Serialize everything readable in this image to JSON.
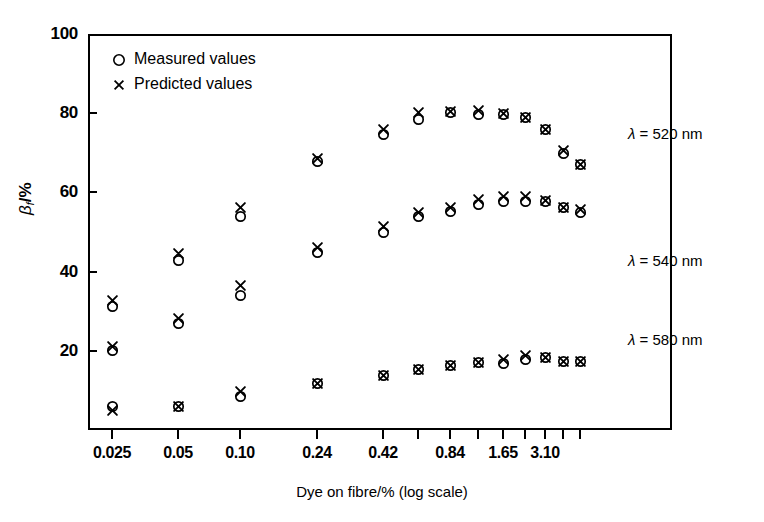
{
  "chart_data": {
    "type": "scatter",
    "title": "",
    "xlabel": "Dye on fibre/% (log scale)",
    "ylabel": "βf/%",
    "ylabel_symbol": "β",
    "ylabel_sub": "f",
    "ylabel_unit": "/%",
    "xscale": "log",
    "ylim": [
      0,
      100
    ],
    "yticks": [
      0,
      20,
      40,
      60,
      80,
      100
    ],
    "ytick_labels": [
      "",
      "20",
      "40",
      "60",
      "80",
      "100"
    ],
    "grid": false,
    "legend_position": "upper-left",
    "legend": [
      "Measured values",
      "Predicted values"
    ],
    "x": [
      0.025,
      0.05,
      0.1,
      0.24,
      0.42,
      0.6,
      0.84,
      1.15,
      1.65,
      2.2,
      3.1,
      4.0,
      5.2
    ],
    "xtick_labels": [
      "0.025",
      "0.05",
      "0.10",
      "0.24",
      "0.42",
      "0.84",
      "1.65",
      "3.10"
    ],
    "xtick_labelled_index": [
      0,
      1,
      2,
      3,
      4,
      6,
      8,
      10
    ],
    "series": [
      {
        "name": "λ = 520 nm",
        "annotation": "λ = 520 nm",
        "measured": [
          20.0,
          42.8,
          53.8,
          67.8,
          74.6,
          78.5,
          80.3,
          79.6,
          79.6,
          78.8,
          75.8,
          69.8,
          67.0
        ],
        "predicted": [
          21.2,
          44.5,
          56.3,
          68.5,
          76.0,
          80.3,
          80.5,
          80.8,
          80.0,
          78.8,
          75.8,
          70.5,
          67.0
        ]
      },
      {
        "name": "λ = 540 nm",
        "annotation": "λ = 540 nm",
        "measured": [
          31.2,
          27.0,
          34.0,
          44.8,
          49.8,
          53.8,
          55.3,
          57.0,
          57.8,
          57.8,
          57.8,
          56.3,
          54.8
        ],
        "predicted": [
          32.6,
          28.2,
          36.5,
          46.2,
          51.5,
          55.0,
          56.3,
          58.3,
          59.0,
          59.0,
          58.0,
          56.3,
          55.8
        ]
      },
      {
        "name": "λ = 580 nm",
        "annotation": "λ = 580 nm",
        "measured": [
          6.0,
          6.0,
          8.5,
          11.8,
          13.8,
          15.2,
          16.2,
          17.0,
          16.8,
          17.8,
          18.2,
          17.2,
          17.2
        ],
        "predicted": [
          5.0,
          6.0,
          9.8,
          11.8,
          13.8,
          15.2,
          16.2,
          17.0,
          17.8,
          18.8,
          18.2,
          17.2,
          17.2
        ]
      }
    ]
  },
  "annotations": [
    {
      "text": "λ = 520 nm",
      "lambda": "λ",
      "rest": " = 520 nm",
      "left": 628,
      "top": 125
    },
    {
      "text": "λ = 540 nm",
      "lambda": "λ",
      "rest": " = 540 nm",
      "left": 628,
      "top": 252
    },
    {
      "text": "λ = 580 nm",
      "lambda": "λ",
      "rest": " = 580 nm",
      "left": 628,
      "top": 331
    }
  ],
  "legend": {
    "items": [
      {
        "glyph": "circle-marker",
        "label": "Measured values"
      },
      {
        "glyph": "cross-marker",
        "label": "Predicted values"
      }
    ]
  },
  "axes": {
    "y_title_symbol": "β",
    "y_title_sub": "f",
    "y_title_unit": "/%",
    "x_title": "Dye on fibre/% (log scale)",
    "y_tick_labels": [
      "100",
      "80",
      "60",
      "40",
      "20"
    ],
    "x_tick_labels": [
      "0.025",
      "0.05",
      "0.10",
      "0.24",
      "0.42",
      "0.84",
      "1.65",
      "3.10"
    ]
  },
  "colors": {
    "foreground": "#000000",
    "background": "#ffffff"
  }
}
